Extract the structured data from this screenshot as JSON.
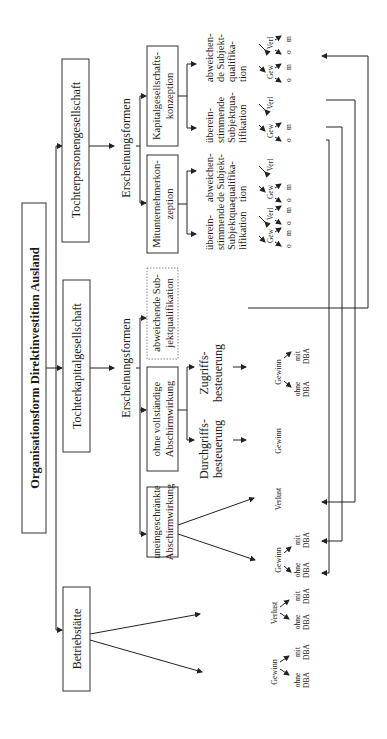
{
  "diagram": {
    "orientation": "rotated-90-ccw",
    "root": {
      "label": "Organisationsform Direktinvestition Ausland"
    },
    "branches": [
      {
        "label": "Betriebstätte",
        "children": [
          {
            "label": "Gewinn",
            "children": [
              "ohne DBA",
              "mit DBA"
            ]
          },
          {
            "label": "Verlust",
            "children": [
              "ohne DBA",
              "mit DBA"
            ]
          }
        ]
      },
      {
        "label": "Tochterkapitalgesellschaft",
        "forms_label": "Erscheinungsformen",
        "forms": [
          {
            "label": "uneingeschränkte Abschirmwirkung",
            "children": [
              {
                "label": "Gewinn",
                "children": [
                  "ohne DBA",
                  "mit DBA"
                ]
              },
              {
                "label": "Verlust"
              }
            ]
          },
          {
            "label": "ohne vollständige Abschirmwirkung",
            "children": [
              {
                "label": "Durchgriffs-besteuerung",
                "result": "Gewinn"
              },
              {
                "label": "Zugriffs-besteuerung",
                "result": "Gewinn",
                "children": [
                  "ohne DBA",
                  "mit DBA"
                ]
              }
            ]
          },
          {
            "label": "abweichende Subjektqualifikation",
            "style": "dotted"
          }
        ]
      },
      {
        "label": "Tochterpersonengesellschaft",
        "forms_label": "Erscheinungsformen",
        "forms": [
          {
            "label": "Mitunternehmerkonzeption",
            "children": [
              {
                "label": "übereinstimmende Subjektqualifikation",
                "leaves": {
                  "Gew": [
                    "o",
                    "m"
                  ],
                  "Verl": [
                    "o",
                    "m"
                  ]
                }
              },
              {
                "label": "abweichende Subjektqualifikation",
                "leaves": {
                  "Gew": [
                    "o",
                    "m"
                  ],
                  "Verl": []
                }
              }
            ]
          },
          {
            "label": "Kapitalgesellschaftskonzeption",
            "children": [
              {
                "label": "übereinstimmende Subjektqualifikation",
                "leaves": {
                  "Gew": [
                    "o",
                    "m"
                  ],
                  "Verl": []
                }
              },
              {
                "label": "abweichende Subjektqualifikation",
                "leaves": {
                  "Gew": [
                    "o",
                    "m"
                  ],
                  "Verl": [
                    "o",
                    "m"
                  ]
                }
              }
            ]
          }
        ]
      }
    ]
  },
  "labels": {
    "root": "Organisationsform Direktinvestition Ausland",
    "betriebstaette": "Betriebstätte",
    "tochterkap": "Tochterkapitalgesellschaft",
    "tochterpers": "Tochterpersonengesellschaft",
    "erscheinungsformen": "Erscheinungsformen",
    "uneingeschraenkte_1": "uneingeschränkte",
    "uneingeschraenkte_2": "Abschirmwirkung",
    "ohne_vollst_1": "ohne vollständige",
    "ohne_vollst_2": "Abschirmwirkung",
    "abweichende_sub_1": "abweichende Sub-",
    "abweichende_sub_2": "jektqualifikation",
    "mitunternehmer_1": "Mitunternehmerkon-",
    "mitunternehmer_2": "zeption",
    "kapges_1": "Kapitalgesellschafts-",
    "kapges_2": "konzeption",
    "durchgriff_1": "Durchgriffs-",
    "durchgriff_2": "besteuerung",
    "zugriff_1": "Zugriffs-",
    "zugriff_2": "besteuerung",
    "ueber_1": "überein-",
    "ueber_2": "stimmende",
    "ueber_3": "Subjektqua-",
    "ueber_4": "lifikation",
    "abw_1": "abweichen-",
    "abw_2": "de Subjekt-",
    "abw_3": "qualifika-",
    "abw_4": "tion",
    "gewinn": "Gewinn",
    "verlust": "Verlust",
    "ohne": "ohne",
    "mit": "mit",
    "dba": "DBA",
    "gew": "Gew",
    "verl": "Verl",
    "o": "o",
    "m": "m"
  }
}
